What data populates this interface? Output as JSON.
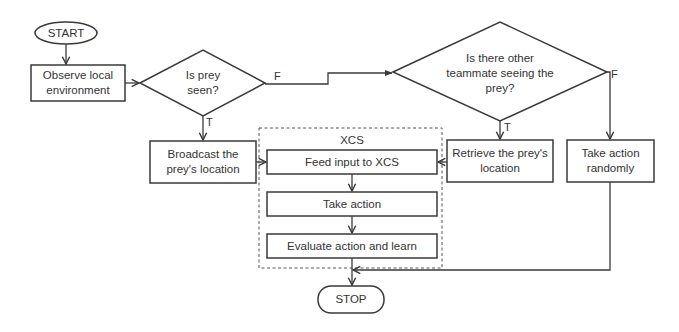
{
  "diagram": {
    "type": "flowchart",
    "nodes": {
      "start": {
        "label": "START",
        "shape": "terminator"
      },
      "observe": {
        "label": "Observe local environment",
        "shape": "process"
      },
      "decision_prey": {
        "label": "Is prey seen?",
        "shape": "decision"
      },
      "decision_teammate": {
        "label": "Is there other teammate seeing the prey?",
        "shape": "decision"
      },
      "broadcast": {
        "label": "Broadcast the prey's location",
        "shape": "process"
      },
      "retrieve": {
        "label": "Retrieve the prey's location",
        "shape": "process"
      },
      "random": {
        "label": "Take action randomly",
        "shape": "process"
      },
      "xcs_group": {
        "label": "XCS",
        "shape": "dashed-group"
      },
      "feed": {
        "label": "Feed input to XCS",
        "shape": "process"
      },
      "take_action": {
        "label": "Take action",
        "shape": "process"
      },
      "evaluate": {
        "label": "Evaluate action and learn",
        "shape": "process"
      },
      "stop": {
        "label": "STOP",
        "shape": "terminator"
      }
    },
    "edge_labels": {
      "prey_false": "F",
      "prey_true": "T",
      "teammate_true": "T",
      "teammate_false": "F"
    },
    "edges": [
      {
        "from": "start",
        "to": "observe"
      },
      {
        "from": "observe",
        "to": "decision_prey"
      },
      {
        "from": "decision_prey",
        "to": "decision_teammate",
        "label": "F"
      },
      {
        "from": "decision_prey",
        "to": "broadcast",
        "label": "T"
      },
      {
        "from": "decision_teammate",
        "to": "retrieve",
        "label": "T"
      },
      {
        "from": "decision_teammate",
        "to": "random",
        "label": "F"
      },
      {
        "from": "broadcast",
        "to": "feed"
      },
      {
        "from": "retrieve",
        "to": "feed"
      },
      {
        "from": "feed",
        "to": "take_action"
      },
      {
        "from": "take_action",
        "to": "evaluate"
      },
      {
        "from": "evaluate",
        "to": "stop"
      },
      {
        "from": "random",
        "to": "stop"
      }
    ]
  }
}
